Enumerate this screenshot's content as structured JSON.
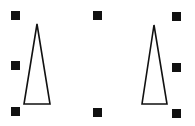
{
  "canvas": {
    "width": 195,
    "height": 126,
    "background": "#ffffff"
  },
  "selection": {
    "handle_color": "#111111",
    "handle_size": 9,
    "handles": [
      {
        "name": "handle-top-left",
        "x": 11,
        "y": 11
      },
      {
        "name": "handle-middle-left",
        "x": 11,
        "y": 61
      },
      {
        "name": "handle-bottom-left",
        "x": 11,
        "y": 107
      },
      {
        "name": "handle-top-center",
        "x": 93,
        "y": 11
      },
      {
        "name": "handle-bottom-center",
        "x": 93,
        "y": 108
      },
      {
        "name": "handle-top-right",
        "x": 172,
        "y": 12
      },
      {
        "name": "handle-middle-right",
        "x": 172,
        "y": 63
      },
      {
        "name": "handle-bottom-right",
        "x": 172,
        "y": 109
      }
    ]
  },
  "shapes": [
    {
      "name": "triangle-left",
      "type": "isosceles-triangle",
      "points": "37,24 50,104 24,104",
      "stroke": "#111111",
      "fill": "#ffffff"
    },
    {
      "name": "triangle-right",
      "type": "isosceles-triangle",
      "points": "154,25 167,104 142,104",
      "stroke": "#111111",
      "fill": "#ffffff"
    }
  ]
}
